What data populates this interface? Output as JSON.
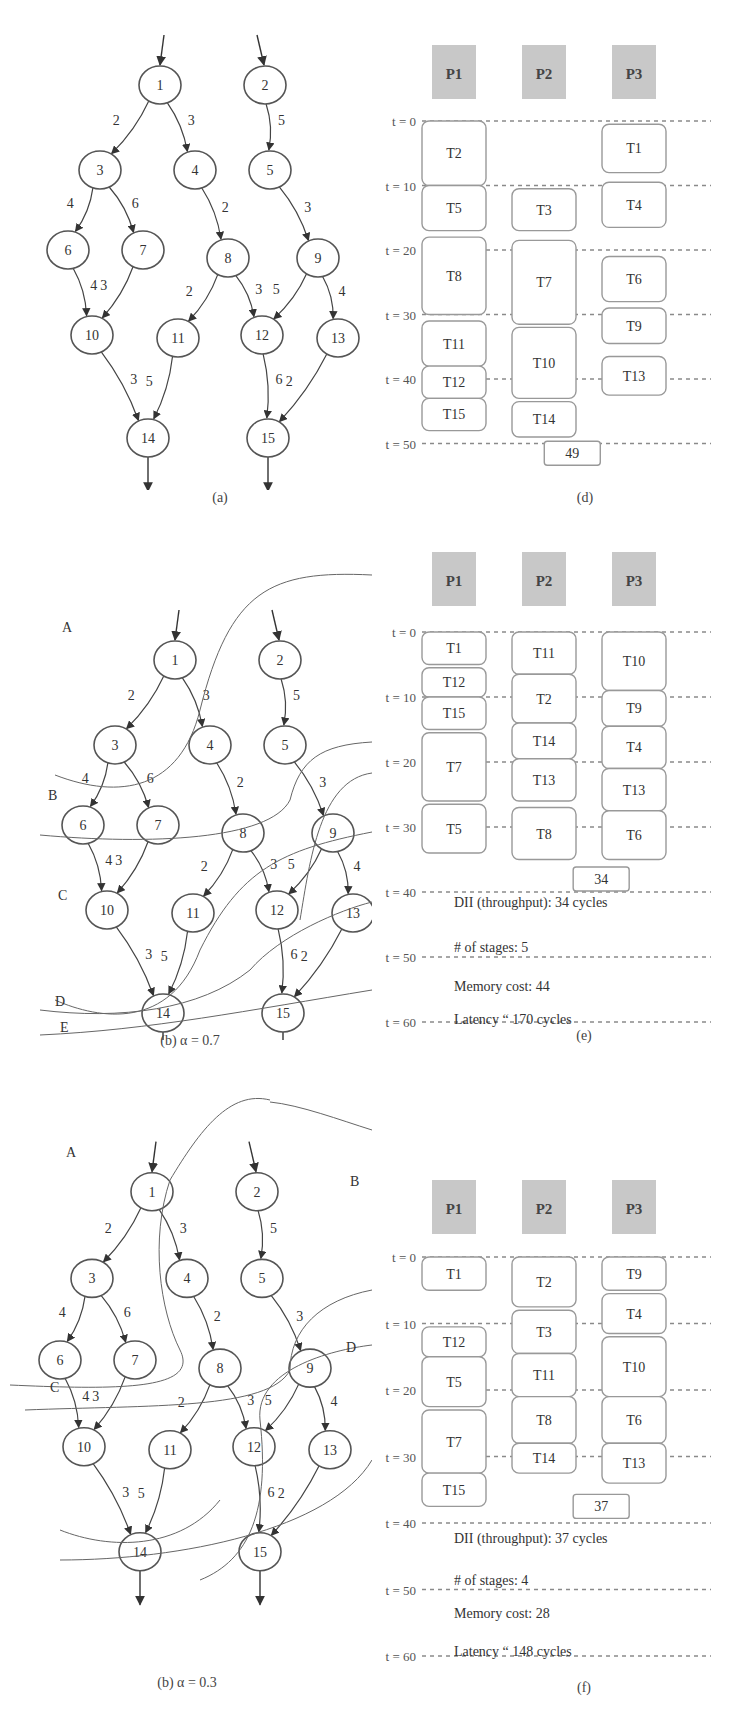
{
  "graph": {
    "nodes": [
      {
        "id": "1",
        "x": 160,
        "y": 85
      },
      {
        "id": "2",
        "x": 265,
        "y": 85
      },
      {
        "id": "3",
        "x": 100,
        "y": 170
      },
      {
        "id": "4",
        "x": 195,
        "y": 170
      },
      {
        "id": "5",
        "x": 270,
        "y": 170
      },
      {
        "id": "6",
        "x": 68,
        "y": 250
      },
      {
        "id": "7",
        "x": 143,
        "y": 250
      },
      {
        "id": "8",
        "x": 228,
        "y": 258
      },
      {
        "id": "9",
        "x": 318,
        "y": 258
      },
      {
        "id": "10",
        "x": 92,
        "y": 335
      },
      {
        "id": "11",
        "x": 178,
        "y": 338
      },
      {
        "id": "12",
        "x": 262,
        "y": 335
      },
      {
        "id": "13",
        "x": 338,
        "y": 338
      },
      {
        "id": "14",
        "x": 148,
        "y": 438
      },
      {
        "id": "15",
        "x": 268,
        "y": 438
      }
    ],
    "edges": [
      {
        "from": "1",
        "to": "3",
        "w": "2"
      },
      {
        "from": "1",
        "to": "4",
        "w": "3"
      },
      {
        "from": "2",
        "to": "5",
        "w": "5"
      },
      {
        "from": "3",
        "to": "6",
        "w": "4"
      },
      {
        "from": "3",
        "to": "7",
        "w": "6"
      },
      {
        "from": "4",
        "to": "8",
        "w": "2"
      },
      {
        "from": "5",
        "to": "9",
        "w": "3"
      },
      {
        "from": "6",
        "to": "10",
        "w": "4"
      },
      {
        "from": "7",
        "to": "10",
        "w": "3"
      },
      {
        "from": "8",
        "to": "11",
        "w": "2"
      },
      {
        "from": "8",
        "to": "12",
        "w": "3"
      },
      {
        "from": "9",
        "to": "12",
        "w": "5"
      },
      {
        "from": "9",
        "to": "13",
        "w": "4"
      },
      {
        "from": "10",
        "to": "14",
        "w": "3"
      },
      {
        "from": "11",
        "to": "14",
        "w": "5"
      },
      {
        "from": "12",
        "to": "15",
        "w": "6"
      },
      {
        "from": "13",
        "to": "15",
        "w": "2"
      }
    ]
  },
  "panels": {
    "a": {
      "caption": "(a)"
    },
    "b07": {
      "caption": "(b) α = 0.7",
      "regions": [
        "A",
        "B",
        "C",
        "D",
        "E"
      ]
    },
    "b03": {
      "caption": "(b) α = 0.3",
      "regions": [
        "A",
        "B",
        "C",
        "D"
      ]
    },
    "d": {
      "caption": "(d)",
      "processors": [
        "P1",
        "P2",
        "P3"
      ],
      "ticks": [
        "t = 0",
        "t = 10",
        "t = 20",
        "t = 30",
        "t = 40",
        "t = 50",
        "t = 60"
      ],
      "tasks": [
        {
          "p": 0,
          "name": "T2",
          "s": 0,
          "e": 10
        },
        {
          "p": 0,
          "name": "T5",
          "s": 10,
          "e": 17
        },
        {
          "p": 0,
          "name": "T8",
          "s": 18,
          "e": 30
        },
        {
          "p": 0,
          "name": "T11",
          "s": 31,
          "e": 38
        },
        {
          "p": 0,
          "name": "T12",
          "s": 38,
          "e": 43
        },
        {
          "p": 0,
          "name": "T15",
          "s": 43,
          "e": 48
        },
        {
          "p": 1,
          "name": "T3",
          "s": 10.5,
          "e": 17
        },
        {
          "p": 1,
          "name": "T7",
          "s": 18.5,
          "e": 31.5
        },
        {
          "p": 1,
          "name": "T10",
          "s": 32,
          "e": 43
        },
        {
          "p": 1,
          "name": "T14",
          "s": 43.5,
          "e": 49
        },
        {
          "p": 2,
          "name": "T1",
          "s": 0.5,
          "e": 8
        },
        {
          "p": 2,
          "name": "T4",
          "s": 9.5,
          "e": 16.5
        },
        {
          "p": 2,
          "name": "T6",
          "s": 21,
          "e": 28
        },
        {
          "p": 2,
          "name": "T9",
          "s": 29,
          "e": 34.5
        },
        {
          "p": 2,
          "name": "T13",
          "s": 36.5,
          "e": 42.5
        }
      ],
      "callout": "49",
      "callout_t": 51.5,
      "callout_x": 0.52,
      "stats": []
    },
    "e": {
      "caption": "(e)",
      "processors": [
        "P1",
        "P2",
        "P3"
      ],
      "ticks": [
        "t = 0",
        "t = 10",
        "t = 20",
        "t = 30",
        "t = 40",
        "t = 50",
        "t = 60"
      ],
      "tasks": [
        {
          "p": 0,
          "name": "T1",
          "s": 0,
          "e": 5
        },
        {
          "p": 0,
          "name": "T12",
          "s": 5.5,
          "e": 10
        },
        {
          "p": 0,
          "name": "T15",
          "s": 10,
          "e": 15
        },
        {
          "p": 0,
          "name": "T7",
          "s": 15.5,
          "e": 26
        },
        {
          "p": 0,
          "name": "T5",
          "s": 26.5,
          "e": 34
        },
        {
          "p": 1,
          "name": "T11",
          "s": 0,
          "e": 6.5
        },
        {
          "p": 1,
          "name": "T2",
          "s": 6.5,
          "e": 14
        },
        {
          "p": 1,
          "name": "T14",
          "s": 14,
          "e": 19.5
        },
        {
          "p": 1,
          "name": "T13",
          "s": 19.5,
          "e": 26
        },
        {
          "p": 1,
          "name": "T8",
          "s": 27,
          "e": 35
        },
        {
          "p": 2,
          "name": "T10",
          "s": 0,
          "e": 9
        },
        {
          "p": 2,
          "name": "T9",
          "s": 9,
          "e": 14.5
        },
        {
          "p": 2,
          "name": "T4",
          "s": 14.5,
          "e": 21
        },
        {
          "p": 2,
          "name": "T13",
          "s": 21,
          "e": 27.5
        },
        {
          "p": 2,
          "name": "T6",
          "s": 27.5,
          "e": 35
        }
      ],
      "callout": "34",
      "callout_t": 38,
      "callout_x": 0.62,
      "stats": [
        {
          "t": 41.5,
          "text": "DII (throughput): 34 cycles"
        },
        {
          "t": 48.5,
          "text": "# of stages: 5"
        },
        {
          "t": 54.5,
          "text": "Memory cost: 44"
        },
        {
          "t": 59.5,
          "text": "Latency “ 170 cycles"
        }
      ]
    },
    "f": {
      "caption": "(f)",
      "processors": [
        "P1",
        "P2",
        "P3"
      ],
      "ticks": [
        "t = 0",
        "t = 10",
        "t = 20",
        "t = 30",
        "t = 40",
        "t = 50",
        "t = 60"
      ],
      "tasks": [
        {
          "p": 0,
          "name": "T1",
          "s": 0,
          "e": 5
        },
        {
          "p": 0,
          "name": "T12",
          "s": 10.5,
          "e": 15
        },
        {
          "p": 0,
          "name": "T5",
          "s": 15,
          "e": 22.5
        },
        {
          "p": 0,
          "name": "T7",
          "s": 23,
          "e": 32.5
        },
        {
          "p": 0,
          "name": "T15",
          "s": 32.5,
          "e": 37.5
        },
        {
          "p": 1,
          "name": "T2",
          "s": 0,
          "e": 7.5
        },
        {
          "p": 1,
          "name": "T3",
          "s": 8,
          "e": 14.5
        },
        {
          "p": 1,
          "name": "T11",
          "s": 14.5,
          "e": 21
        },
        {
          "p": 1,
          "name": "T8",
          "s": 21,
          "e": 28
        },
        {
          "p": 1,
          "name": "T14",
          "s": 28,
          "e": 32.5
        },
        {
          "p": 2,
          "name": "T9",
          "s": 0,
          "e": 5
        },
        {
          "p": 2,
          "name": "T4",
          "s": 5.5,
          "e": 11.5
        },
        {
          "p": 2,
          "name": "T10",
          "s": 12,
          "e": 21
        },
        {
          "p": 2,
          "name": "T6",
          "s": 21,
          "e": 28
        },
        {
          "p": 2,
          "name": "T13",
          "s": 28,
          "e": 34
        }
      ],
      "callout": "37",
      "callout_t": 37.5,
      "callout_x": 0.62,
      "stats": [
        {
          "t": 42.2,
          "text": "DII (throughput): 37 cycles"
        },
        {
          "t": 48.5,
          "text": "# of stages: 4"
        },
        {
          "t": 53.5,
          "text": "Memory cost: 28"
        },
        {
          "t": 59.2,
          "text": "Latency “ 148 cycles"
        }
      ]
    }
  },
  "colors": {
    "node_stroke": "#555555",
    "proc_fill": "#c8c8c8",
    "task_stroke": "#999999",
    "dash": "#8a8a8a",
    "text": "#333333"
  }
}
